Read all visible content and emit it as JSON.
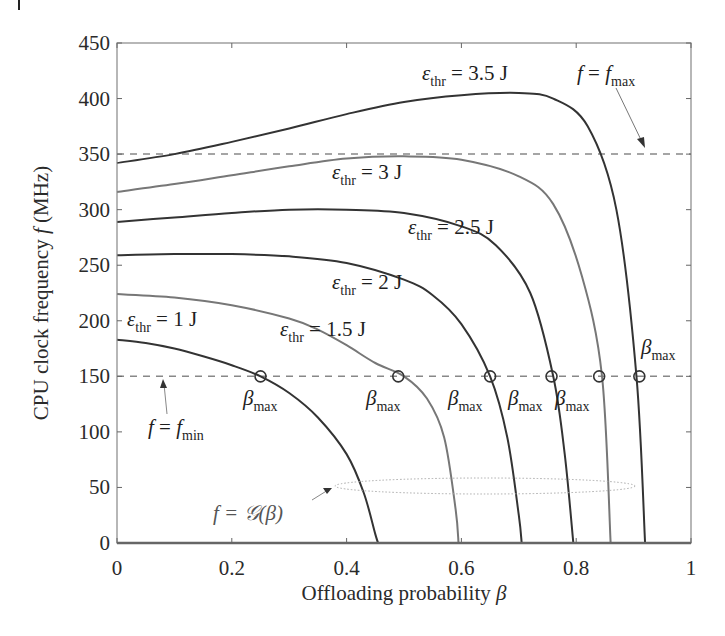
{
  "chart_data": {
    "type": "line",
    "title": "",
    "xlabel": "Offloading probability β",
    "ylabel": "CPU clock frequency f (MHz)",
    "xlim": [
      0,
      1
    ],
    "ylim": [
      0,
      450
    ],
    "xticks": [
      0,
      0.2,
      0.4,
      0.6,
      0.8,
      1
    ],
    "xtick_labels": [
      "0",
      "0.2",
      "0.4",
      "0.6",
      "0.8",
      "1"
    ],
    "yticks": [
      0,
      50,
      100,
      150,
      200,
      250,
      300,
      350,
      400,
      450
    ],
    "ytick_labels": [
      "0",
      "50",
      "100",
      "150",
      "200",
      "250",
      "300",
      "350",
      "400",
      "450"
    ],
    "grid": false,
    "legend": "none (inline annotations)",
    "series": [
      {
        "name": "ε_thr = 1 J",
        "color": "#333333",
        "x": [
          0,
          0.05,
          0.1,
          0.15,
          0.2,
          0.25,
          0.3,
          0.35,
          0.4,
          0.43,
          0.45,
          0.455
        ],
        "y": [
          183,
          180,
          175,
          168,
          160,
          150,
          135,
          113,
          80,
          45,
          8,
          0
        ]
      },
      {
        "name": "ε_thr = 1.5 J",
        "color": "#777777",
        "x": [
          0,
          0.1,
          0.2,
          0.3,
          0.35,
          0.4,
          0.45,
          0.5,
          0.54,
          0.57,
          0.59,
          0.595
        ],
        "y": [
          224,
          221,
          214,
          202,
          192,
          178,
          162,
          150,
          130,
          95,
          30,
          0
        ]
      },
      {
        "name": "ε_thr = 2 J",
        "color": "#333333",
        "x": [
          0,
          0.1,
          0.2,
          0.3,
          0.4,
          0.5,
          0.55,
          0.6,
          0.65,
          0.68,
          0.7,
          0.705
        ],
        "y": [
          259,
          260,
          260,
          258,
          252,
          237,
          223,
          197,
          150,
          95,
          25,
          0
        ]
      },
      {
        "name": "ε_thr = 2.5 J",
        "color": "#333333",
        "x": [
          0,
          0.1,
          0.2,
          0.3,
          0.4,
          0.5,
          0.6,
          0.66,
          0.72,
          0.76,
          0.78,
          0.795
        ],
        "y": [
          289,
          293,
          297,
          300,
          300,
          297,
          285,
          268,
          225,
          150,
          80,
          0
        ]
      },
      {
        "name": "ε_thr = 3 J",
        "color": "#777777",
        "x": [
          0,
          0.1,
          0.2,
          0.3,
          0.4,
          0.5,
          0.6,
          0.7,
          0.76,
          0.81,
          0.845,
          0.86
        ],
        "y": [
          316,
          323,
          331,
          339,
          346,
          348,
          345,
          330,
          305,
          240,
          150,
          0
        ]
      },
      {
        "name": "ε_thr = 3.5 J",
        "color": "#333333",
        "x": [
          0,
          0.1,
          0.2,
          0.3,
          0.4,
          0.5,
          0.6,
          0.7,
          0.76,
          0.82,
          0.87,
          0.905,
          0.92
        ],
        "y": [
          342,
          350,
          361,
          373,
          386,
          397,
          403,
          405,
          400,
          375,
          300,
          150,
          0
        ]
      }
    ],
    "reference_lines": [
      {
        "name": "f = f_max",
        "y": 350,
        "style": "dashed"
      },
      {
        "name": "f = f_min",
        "y": 150,
        "style": "dashed"
      }
    ],
    "markers": {
      "label": "β_max",
      "points": [
        {
          "x": 0.25,
          "y": 150
        },
        {
          "x": 0.49,
          "y": 150
        },
        {
          "x": 0.65,
          "y": 150
        },
        {
          "x": 0.757,
          "y": 150
        },
        {
          "x": 0.84,
          "y": 150
        },
        {
          "x": 0.91,
          "y": 150
        }
      ]
    },
    "annotations": [
      "ε_thr = 3.5 J",
      "ε_thr = 3 J",
      "ε_thr = 2.5 J",
      "ε_thr = 2 J",
      "ε_thr = 1.5 J",
      "ε_thr = 1 J",
      "f = f_max",
      "f = f_min",
      "f = G(β)"
    ],
    "g_region": {
      "label": "f = G(β)",
      "x_range": [
        0.4,
        0.9
      ],
      "y_range": [
        45,
        60
      ],
      "style": "dotted ellipse"
    }
  },
  "labels": {
    "xlabel_text": "Offloading probability ",
    "xlabel_sym": "β",
    "ylabel_text": "CPU clock frequency ",
    "ylabel_sym": "f",
    "ylabel_unit": " (MHz)",
    "eps": "ε",
    "thr": "thr",
    "e35": " = 3.5 J",
    "e3": " = 3 J",
    "e25": " = 2.5 J",
    "e2": " = 2 J",
    "e15": " = 1.5 J",
    "e1": " = 1 J",
    "beta": "β",
    "max": "max",
    "min": "min",
    "f": "f",
    "eq": " = ",
    "g_expr": "f = 𝒢(β)"
  }
}
